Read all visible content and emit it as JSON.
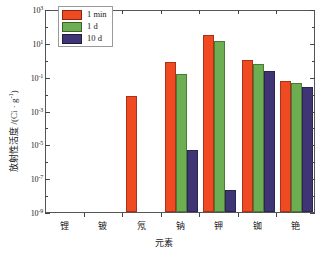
{
  "chart_data": {
    "type": "bar",
    "title": "",
    "xlabel": "元素",
    "ylabel": "放射性活度 /(Ci · g⁻¹)",
    "ylabel_main": "放射性活度 /(Ci · g",
    "ylabel_exp": "-1",
    "ylabel_tail": ")",
    "categories": [
      "锂",
      "铍",
      "氖",
      "钠",
      "钾",
      "铷",
      "铯"
    ],
    "legend_position": "top-left",
    "grid": false,
    "yscale": "log",
    "ylim": [
      1e-09,
      1000
    ],
    "ytick_labels": [
      "10³",
      "10¹",
      "10⁻¹",
      "10⁻³",
      "10⁻⁵",
      "10⁻⁷",
      "10⁻⁹"
    ],
    "ytick_mantissa": "10",
    "ytick_exponents": [
      "3",
      "1",
      "-1",
      "-3",
      "-5",
      "-7",
      "-9"
    ],
    "ytick_values": [
      1000,
      10,
      0.1,
      0.001,
      1e-05,
      1e-07,
      1e-09
    ],
    "series": [
      {
        "name": "1 min",
        "color": "#F04A23",
        "values": [
          null,
          null,
          0.0068,
          0.72,
          31.0,
          0.95,
          0.055
        ]
      },
      {
        "name": "1 d",
        "color": "#6DAE52",
        "values": [
          null,
          null,
          null,
          0.14,
          13.0,
          0.58,
          0.042
        ]
      },
      {
        "name": "10 d",
        "color": "#3F3575",
        "values": [
          null,
          null,
          null,
          4.5e-06,
          2e-08,
          0.21,
          0.026
        ]
      }
    ]
  },
  "axis": {
    "x_title": "元素",
    "y_title_prefix": "放射性活度 /(Ci · g",
    "y_title_exp": "-1",
    "y_title_suffix": ")"
  },
  "legend": {
    "items": [
      {
        "label": "1 min",
        "color": "#F04A23"
      },
      {
        "label": "1 d",
        "color": "#6DAE52"
      },
      {
        "label": "10 d",
        "color": "#3F3575"
      }
    ]
  }
}
